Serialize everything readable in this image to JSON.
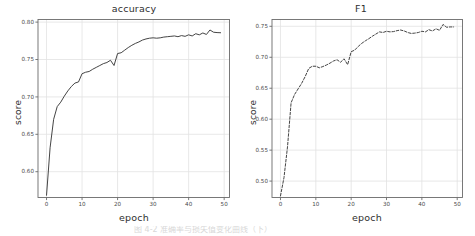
{
  "figure": {
    "width": 475,
    "height": 236,
    "background": "#ffffff",
    "line_color": "#3a3a3a",
    "grid_color": "#e2e2e2",
    "axis_color": "#6b6b6b",
    "caption_partial": "图 4-2  准确率与损失值变化曲线（下）"
  },
  "chart_data": [
    {
      "id": "accuracy",
      "type": "line",
      "title": "accuracy",
      "xlabel": "epoch",
      "ylabel": "score",
      "linestyle": "solid",
      "grid": true,
      "legend": null,
      "xlim": [
        -2.4,
        51.5
      ],
      "ylim": [
        0.5655,
        0.8035
      ],
      "xticks": [
        0,
        10,
        20,
        30,
        40,
        50
      ],
      "xticklabels": [
        "0",
        "10",
        "20",
        "30",
        "40",
        "50"
      ],
      "yticks": [
        0.6,
        0.65,
        0.7,
        0.75,
        0.8
      ],
      "yticklabels": [
        "0.60",
        "0.65",
        "0.70",
        "0.75",
        "0.80"
      ],
      "x": [
        0,
        1,
        2,
        3,
        4,
        5,
        6,
        7,
        8,
        9,
        10,
        11,
        12,
        13,
        14,
        15,
        16,
        17,
        18,
        19,
        20,
        21,
        22,
        23,
        24,
        25,
        26,
        27,
        28,
        29,
        30,
        31,
        32,
        33,
        34,
        35,
        36,
        37,
        38,
        39,
        40,
        41,
        42,
        43,
        44,
        45,
        46,
        47,
        48,
        49
      ],
      "values": [
        0.5685,
        0.632,
        0.67,
        0.687,
        0.693,
        0.701,
        0.708,
        0.714,
        0.7185,
        0.72,
        0.731,
        0.733,
        0.734,
        0.737,
        0.7395,
        0.742,
        0.7445,
        0.746,
        0.749,
        0.742,
        0.758,
        0.759,
        0.7625,
        0.766,
        0.769,
        0.7715,
        0.7735,
        0.776,
        0.7775,
        0.7785,
        0.779,
        0.7785,
        0.779,
        0.78,
        0.7805,
        0.781,
        0.7815,
        0.7805,
        0.782,
        0.781,
        0.783,
        0.7815,
        0.7845,
        0.783,
        0.7855,
        0.7835,
        0.7895,
        0.7865,
        0.786,
        0.7858
      ]
    },
    {
      "id": "f1",
      "type": "line",
      "title": "F1",
      "xlabel": "epoch",
      "ylabel": "score",
      "linestyle": "dashed",
      "grid": true,
      "legend": null,
      "xlim": [
        -2.4,
        51.5
      ],
      "ylim": [
        0.4735,
        0.761
      ],
      "xticks": [
        0,
        10,
        20,
        30,
        40,
        50
      ],
      "xticklabels": [
        "0",
        "10",
        "20",
        "30",
        "40",
        "50"
      ],
      "yticks": [
        0.5,
        0.55,
        0.6,
        0.65,
        0.7,
        0.75
      ],
      "yticklabels": [
        "0.50",
        "0.55",
        "0.60",
        "0.65",
        "0.70",
        "0.75"
      ],
      "x": [
        0,
        1,
        2,
        3,
        4,
        5,
        6,
        7,
        8,
        9,
        10,
        11,
        12,
        13,
        14,
        15,
        16,
        17,
        18,
        19,
        20,
        21,
        22,
        23,
        24,
        25,
        26,
        27,
        28,
        29,
        30,
        31,
        32,
        33,
        34,
        35,
        36,
        37,
        38,
        39,
        40,
        41,
        42,
        43,
        44,
        45,
        46,
        47,
        48,
        49
      ],
      "values": [
        0.476,
        0.506,
        0.556,
        0.6265,
        0.64,
        0.649,
        0.658,
        0.669,
        0.682,
        0.6855,
        0.6855,
        0.683,
        0.685,
        0.6875,
        0.6905,
        0.694,
        0.696,
        0.692,
        0.6975,
        0.688,
        0.709,
        0.7115,
        0.7175,
        0.7225,
        0.7265,
        0.73,
        0.734,
        0.7375,
        0.741,
        0.74,
        0.742,
        0.741,
        0.7415,
        0.743,
        0.744,
        0.7425,
        0.74,
        0.7385,
        0.739,
        0.74,
        0.742,
        0.741,
        0.7445,
        0.7425,
        0.746,
        0.7435,
        0.753,
        0.7485,
        0.749,
        0.749
      ]
    }
  ]
}
